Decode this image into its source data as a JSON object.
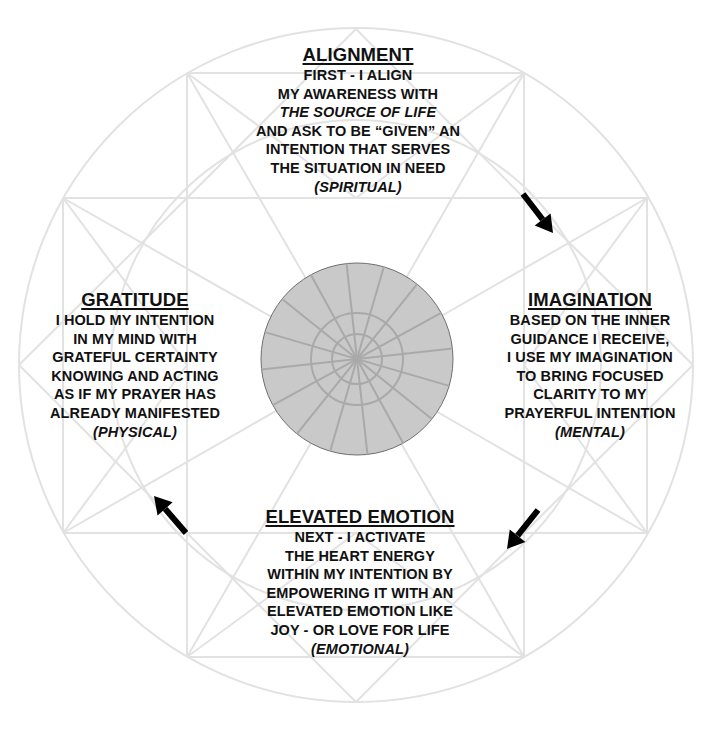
{
  "colors": {
    "text": "#111111",
    "line_art": "#e2e2e2",
    "center_fill": "#c9c9c9",
    "center_lines": "#a9a9a9",
    "arrow": "#000000"
  },
  "sections": {
    "top": {
      "title": "ALIGNMENT",
      "lines": [
        "FIRST - I ALIGN",
        "MY AWARENESS WITH"
      ],
      "italic_line": "THE SOURCE OF LIFE",
      "lines2": [
        "AND ASK TO BE “GIVEN” AN",
        "INTENTION THAT SERVES",
        "THE SITUATION IN NEED"
      ],
      "category": "(SPIRITUAL)"
    },
    "right": {
      "title": "IMAGINATION",
      "lines": [
        "BASED ON THE INNER",
        "GUIDANCE I RECEIVE,",
        "I USE MY IMAGINATION",
        "TO BRING FOCUSED",
        "CLARITY TO MY",
        "PRAYERFUL INTENTION"
      ],
      "category": "(MENTAL)"
    },
    "bottom": {
      "title": "ELEVATED EMOTION",
      "lines": [
        "NEXT - I ACTIVATE",
        "THE HEART ENERGY",
        "WITHIN MY INTENTION BY",
        "EMPOWERING IT WITH AN",
        "ELEVATED EMOTION LIKE",
        "JOY - OR LOVE FOR LIFE"
      ],
      "category": "(EMOTIONAL)"
    },
    "left": {
      "title": "GRATITUDE",
      "lines": [
        "I HOLD MY INTENTION",
        "IN MY MIND WITH",
        "GRATEFUL CERTAINTY",
        "KNOWING AND ACTING",
        "AS IF MY PRAYER HAS",
        "ALREADY MANIFESTED"
      ],
      "category": "(PHYSICAL)"
    }
  },
  "flow": {
    "direction": "clockwise",
    "arrows": [
      {
        "from": "ALIGNMENT",
        "to": "IMAGINATION",
        "icon": "arrow-down-right-icon"
      },
      {
        "from": "IMAGINATION",
        "to": "ELEVATED EMOTION",
        "icon": "arrow-down-left-icon"
      },
      {
        "from": "ELEVATED EMOTION",
        "to": "GRATITUDE",
        "icon": "arrow-up-left-icon"
      }
    ]
  }
}
